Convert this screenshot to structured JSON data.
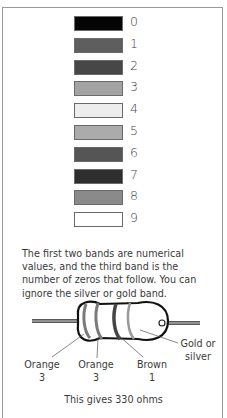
{
  "color_code": {
    "swatches": [
      {
        "value": "0",
        "color": "#050505"
      },
      {
        "value": "1",
        "color": "#5e5e5e"
      },
      {
        "value": "2",
        "color": "#474747"
      },
      {
        "value": "3",
        "color": "#a3a3a3"
      },
      {
        "value": "4",
        "color": "#ededed"
      },
      {
        "value": "5",
        "color": "#ababab"
      },
      {
        "value": "6",
        "color": "#555555"
      },
      {
        "value": "7",
        "color": "#2e2e2e"
      },
      {
        "value": "8",
        "color": "#8a8a8a"
      },
      {
        "value": "9",
        "color": "#ffffff"
      }
    ]
  },
  "description": "The first two bands are numerical values, and the third band is the number of zeros that follow. You can ignore the silver or gold band.",
  "resistor": {
    "labels": [
      {
        "name": "Orange",
        "value": "3"
      },
      {
        "name": "Orange",
        "value": "3"
      },
      {
        "name": "Brown",
        "value": "1"
      },
      {
        "name": "Gold or",
        "value": "silver"
      }
    ],
    "caption": "This gives 330 ohms"
  }
}
